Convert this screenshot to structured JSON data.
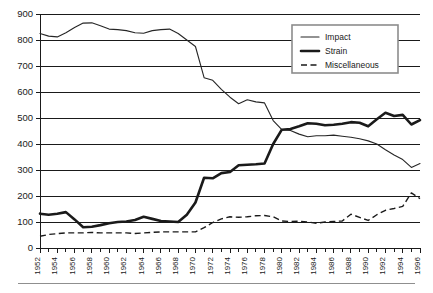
{
  "chart_data": {
    "type": "line",
    "title": "",
    "subtitle": "",
    "xlabel": "",
    "ylabel": "",
    "xlim": [
      1952,
      1996
    ],
    "ylim": [
      0,
      900
    ],
    "ytick_step": 100,
    "yticks": [
      0,
      100,
      200,
      300,
      400,
      500,
      600,
      700,
      800,
      900
    ],
    "xticks": [
      1952,
      1954,
      1956,
      1958,
      1960,
      1962,
      1964,
      1966,
      1968,
      1970,
      1972,
      1974,
      1976,
      1978,
      1980,
      1982,
      1984,
      1986,
      1988,
      1990,
      1992,
      1994,
      1996
    ],
    "xtick_minor_every": 1,
    "xtick_label_rotation": -90,
    "grid": "horizontal",
    "legend_position": "top-right",
    "x": [
      1952,
      1953,
      1954,
      1955,
      1956,
      1957,
      1958,
      1959,
      1960,
      1961,
      1962,
      1963,
      1964,
      1965,
      1966,
      1967,
      1968,
      1969,
      1970,
      1971,
      1972,
      1973,
      1974,
      1975,
      1976,
      1977,
      1978,
      1979,
      1980,
      1981,
      1982,
      1983,
      1984,
      1985,
      1986,
      1987,
      1988,
      1989,
      1990,
      1991,
      1992,
      1993,
      1994,
      1995,
      1996
    ],
    "series": [
      {
        "name": "Impact",
        "style": "thin-solid",
        "color": "#262626",
        "values": [
          825,
          815,
          812,
          828,
          848,
          865,
          866,
          855,
          842,
          840,
          836,
          828,
          826,
          836,
          840,
          842,
          825,
          800,
          775,
          655,
          645,
          610,
          580,
          555,
          570,
          562,
          558,
          490,
          455,
          452,
          438,
          428,
          432,
          432,
          434,
          430,
          426,
          420,
          412,
          400,
          378,
          358,
          340,
          310,
          325
        ]
      },
      {
        "name": "Strain",
        "style": "thick-solid",
        "color": "#1a1a1a",
        "values": [
          132,
          128,
          132,
          138,
          110,
          80,
          82,
          88,
          95,
          100,
          102,
          108,
          120,
          112,
          104,
          102,
          100,
          128,
          175,
          270,
          268,
          288,
          292,
          318,
          320,
          322,
          325,
          400,
          455,
          458,
          468,
          480,
          478,
          472,
          474,
          478,
          484,
          482,
          468,
          495,
          520,
          508,
          512,
          475,
          492
        ]
      },
      {
        "name": "Miscellaneous",
        "style": "dashed",
        "color": "#1a1a1a",
        "values": [
          45,
          52,
          55,
          58,
          58,
          58,
          60,
          58,
          58,
          58,
          58,
          56,
          58,
          60,
          62,
          62,
          62,
          62,
          62,
          78,
          98,
          112,
          120,
          118,
          120,
          124,
          125,
          120,
          104,
          102,
          103,
          100,
          95,
          100,
          102,
          104,
          130,
          118,
          106,
          128,
          145,
          152,
          160,
          212,
          190
        ]
      }
    ]
  },
  "legend": {
    "entries": [
      {
        "label": "Impact",
        "marker": "thin-solid-line"
      },
      {
        "label": "Strain",
        "marker": "thick-solid-line"
      },
      {
        "label": "Miscellaneous",
        "marker": "dashed-line"
      }
    ]
  },
  "axes": {
    "y_tick_labels": [
      "900",
      "800",
      "700",
      "600",
      "500",
      "400",
      "300",
      "200",
      "100",
      "0"
    ],
    "x_tick_labels": [
      "1952",
      "1954",
      "1956",
      "1958",
      "1960",
      "1962",
      "1964",
      "1966",
      "1968",
      "1970",
      "1972",
      "1974",
      "1976",
      "1978",
      "1980",
      "1982",
      "1984",
      "1986",
      "1988",
      "1990",
      "1992",
      "1994",
      "1996"
    ]
  },
  "colors": {
    "ink": "#1a1a1a",
    "grid": "#1a1a1a",
    "legend_border": "#8c8c8c",
    "footer_rule": "#8f8f8f",
    "background": "#ffffff"
  }
}
